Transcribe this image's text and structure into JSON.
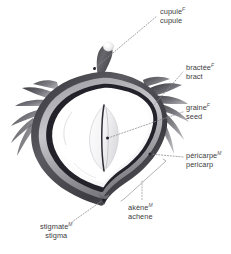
{
  "figure": {
    "background_color": "#ffffff",
    "text_color": "#3d3c40",
    "leader_line_color": "#8d8c92",
    "dot_marker_color": "#2b2a2e"
  },
  "labels": [
    {
      "id": "cupule",
      "french": "cupule",
      "french_gender": "F",
      "english": "cupule",
      "align": "left"
    },
    {
      "id": "bractee",
      "french": "bractée",
      "french_gender": "F",
      "english": "bract",
      "align": "left"
    },
    {
      "id": "graine",
      "french": "graine",
      "french_gender": "F",
      "english": "seed",
      "align": "left"
    },
    {
      "id": "pericarpe",
      "french": "péricarpe",
      "french_gender": "M",
      "english": "pericarp",
      "align": "left"
    },
    {
      "id": "akene",
      "french": "akène",
      "french_gender": "M",
      "english": "achene",
      "align": "left"
    },
    {
      "id": "stigmate",
      "french": "stigmate",
      "french_gender": "M",
      "english": "stigma",
      "align": "center"
    }
  ],
  "illustration": {
    "parts": [
      "cupule-stalk",
      "bract-spikes-left",
      "bract-spikes-right",
      "pericarp-shell",
      "inner-cavity",
      "seed-kernel",
      "stigma-tip"
    ],
    "shell_dark": "#4a4a4e",
    "shell_mid": "#8e8e92",
    "shell_light": "#d5d5d8",
    "cavity_fill": "#fbfbfc",
    "seed_outline": "#b9b9bd"
  }
}
